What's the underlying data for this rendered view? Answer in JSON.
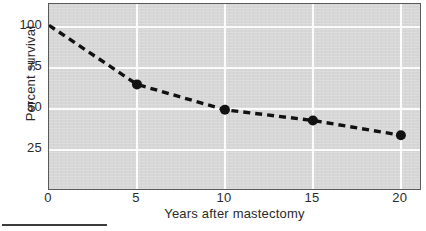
{
  "chart_data": {
    "type": "line",
    "title": "",
    "subtitle": "",
    "xlabel": "Years after mastectomy",
    "ylabel": "Percent survival",
    "x": [
      0,
      5,
      10,
      15,
      20
    ],
    "values": [
      101,
      65,
      49.5,
      43,
      34
    ],
    "series": [
      {
        "name": "Percent survival",
        "x": [
          0,
          5,
          10,
          15,
          20
        ],
        "values": [
          101,
          65,
          49.5,
          43,
          34
        ],
        "line_style": "dashed",
        "line_color": "#111111",
        "marker": "filled-circle",
        "marker_color": "#111111",
        "markers_shown_at_x": [
          5,
          10,
          15,
          20
        ]
      }
    ],
    "xlim": [
      0,
      21.2
    ],
    "ylim": [
      0,
      114
    ],
    "xticks": [
      0,
      5,
      10,
      15,
      20
    ],
    "yticks": [
      25,
      50,
      75,
      100
    ],
    "xtick_labels": [
      "0",
      "5",
      "10",
      "15",
      "20"
    ],
    "ytick_labels": [
      "25",
      "50",
      "75",
      "100"
    ],
    "grid": true,
    "grid_color": "#fbfbfb",
    "plot_background": "#d7d7d7",
    "legend": null,
    "legend_position": "none",
    "annotations": []
  },
  "figure": {
    "background": "#ffffff",
    "border_color": "#5a5a5a",
    "footer_rule_color": "#3c3c3c"
  }
}
